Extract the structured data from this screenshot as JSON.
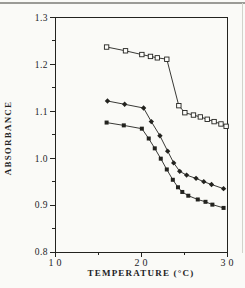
{
  "page": {
    "background": "#fafaf7",
    "ink_color": "#23231f",
    "top_rule_color": "#9b9b96"
  },
  "chart_data": {
    "type": "line",
    "title": "",
    "xlabel": "TEMPERATURE (°C)",
    "ylabel": "ABSORBANCE",
    "xlim": [
      10,
      30
    ],
    "ylim": [
      0.8,
      1.3
    ],
    "grid": false,
    "legend": "none",
    "frame": "full-box",
    "x_major_ticks": [
      10,
      20,
      30
    ],
    "x_tick_labels": [
      "10",
      "20",
      "30"
    ],
    "x_minor_ticks": [
      15,
      25
    ],
    "y_major_ticks": [
      0.8,
      0.9,
      1.0,
      1.1,
      1.2,
      1.3
    ],
    "y_tick_labels": [
      "0.8",
      "0.9",
      "1.0",
      "1.1",
      "1.2",
      "1.3"
    ],
    "y_minor_ticks": [
      0.85,
      0.95,
      1.05,
      1.15,
      1.25
    ],
    "series": [
      {
        "name": "upper-curve-open-squares",
        "marker": "open-square",
        "points": [
          [
            16.0,
            1.237
          ],
          [
            18.2,
            1.229
          ],
          [
            20.1,
            1.221
          ],
          [
            21.1,
            1.217
          ],
          [
            21.9,
            1.214
          ],
          [
            23.0,
            1.211
          ],
          [
            24.4,
            1.112
          ],
          [
            25.1,
            1.097
          ],
          [
            26.1,
            1.092
          ],
          [
            26.9,
            1.088
          ],
          [
            27.7,
            1.083
          ],
          [
            28.5,
            1.078
          ],
          [
            29.3,
            1.073
          ],
          [
            29.9,
            1.068
          ]
        ]
      },
      {
        "name": "middle-curve-filled-diamonds",
        "marker": "filled-diamond",
        "points": [
          [
            16.1,
            1.122
          ],
          [
            18.1,
            1.115
          ],
          [
            20.3,
            1.107
          ],
          [
            21.2,
            1.078
          ],
          [
            22.2,
            1.048
          ],
          [
            23.1,
            1.015
          ],
          [
            23.8,
            0.99
          ],
          [
            24.5,
            0.972
          ],
          [
            25.3,
            0.964
          ],
          [
            26.4,
            0.957
          ],
          [
            27.3,
            0.95
          ],
          [
            28.2,
            0.944
          ],
          [
            29.6,
            0.935
          ]
        ]
      },
      {
        "name": "lower-curve-filled-squares",
        "marker": "filled-square",
        "points": [
          [
            16.0,
            1.076
          ],
          [
            18.0,
            1.07
          ],
          [
            20.1,
            1.063
          ],
          [
            20.9,
            1.042
          ],
          [
            21.6,
            1.021
          ],
          [
            22.3,
            0.999
          ],
          [
            23.0,
            0.976
          ],
          [
            23.7,
            0.954
          ],
          [
            24.3,
            0.938
          ],
          [
            24.8,
            0.928
          ],
          [
            25.5,
            0.92
          ],
          [
            26.6,
            0.912
          ],
          [
            27.5,
            0.907
          ],
          [
            28.3,
            0.901
          ],
          [
            29.6,
            0.894
          ]
        ]
      }
    ]
  }
}
